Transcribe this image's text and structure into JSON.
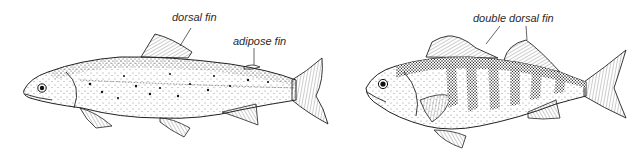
{
  "figure": {
    "fish_left": {
      "name": "trout",
      "labels": {
        "dorsal": "dorsal fin",
        "adipose": "adipose fin"
      }
    },
    "fish_right": {
      "name": "perch",
      "labels": {
        "double_dorsal": "double dorsal fin"
      }
    }
  },
  "colors": {
    "ink": "#1a1a1a",
    "background": "#ffffff"
  }
}
